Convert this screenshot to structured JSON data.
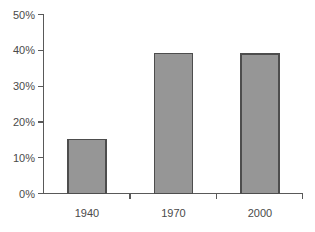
{
  "chart_data": {
    "type": "bar",
    "title": "",
    "subtitle": "",
    "xlabel": "",
    "ylabel": "",
    "categories": [
      "1940",
      "1970",
      "2000"
    ],
    "values": [
      6,
      15,
      39
    ],
    "value_unit": "%",
    "ylim": [
      0,
      50
    ],
    "ytick_values": [
      0,
      10,
      20,
      30,
      40,
      50
    ],
    "ytick_labels": [
      "0%",
      "10%",
      "20%",
      "30%",
      "40%",
      "50%"
    ],
    "xtick_labels": [
      "1940",
      "1970",
      "2000"
    ],
    "grid": false,
    "legend": null,
    "legend_position": "none",
    "annotations": [],
    "series": [
      {
        "name": "",
        "values": [
          6,
          15,
          39
        ]
      }
    ],
    "colors": {
      "bar_fill": "#969696",
      "bar_border": "#4d4d4d",
      "axis": "#595959",
      "tick_text": "#4a4a4a",
      "background": "#ffffff"
    }
  }
}
